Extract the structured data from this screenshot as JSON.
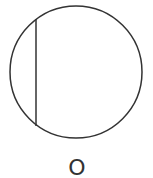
{
  "diagram": {
    "type": "circle-with-chord",
    "circle": {
      "cx": 76,
      "cy": 72,
      "r": 66,
      "stroke": "#333333"
    },
    "chord": {
      "x": 36,
      "y1": 19,
      "y2": 126,
      "stroke": "#333333"
    },
    "center_label": "O",
    "label_position": {
      "x": 77,
      "y": 175
    }
  }
}
